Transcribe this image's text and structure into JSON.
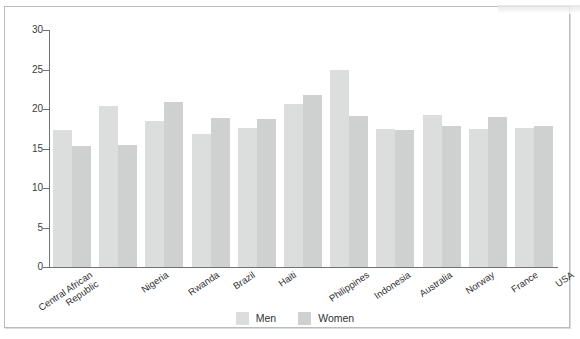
{
  "chart_data": {
    "type": "bar",
    "title": "",
    "xlabel": "",
    "ylabel": "",
    "ylim": [
      0,
      30
    ],
    "yticks": [
      0,
      5,
      10,
      15,
      20,
      25,
      30
    ],
    "grid": false,
    "legend_position": "bottom-center",
    "categories": [
      "Central African Republic",
      "Nigeria",
      "Rwanda",
      "Brazil",
      "Haiti",
      "Philippines",
      "Indonesia",
      "Australia",
      "Norway",
      "France",
      "USA"
    ],
    "series": [
      {
        "name": "Men",
        "color": "#dcdddd",
        "values": [
          17.3,
          20.4,
          18.5,
          16.8,
          17.6,
          20.6,
          25.0,
          17.5,
          19.2,
          17.5,
          17.6
        ]
      },
      {
        "name": "Women",
        "color": "#cfd1d1",
        "values": [
          15.3,
          15.4,
          20.9,
          18.8,
          18.7,
          21.8,
          19.1,
          17.3,
          17.9,
          19.0,
          17.8
        ]
      }
    ]
  },
  "legend": {
    "items": [
      {
        "label": "Men",
        "color": "#dcdddd"
      },
      {
        "label": "Women",
        "color": "#cfd1d1"
      }
    ]
  }
}
